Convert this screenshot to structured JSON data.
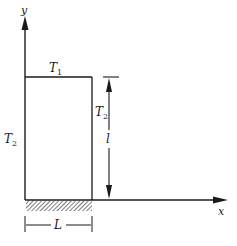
{
  "diagram": {
    "axes": {
      "x_label": "x",
      "y_label": "y"
    },
    "edges": {
      "top": {
        "symbol": "T",
        "subscript": "1"
      },
      "left": {
        "symbol": "T",
        "subscript": "2"
      },
      "right": {
        "symbol": "T",
        "subscript": "2"
      }
    },
    "dimensions": {
      "height_label": "l",
      "width_label": "L"
    },
    "colors": {
      "line": "#1a1a1a",
      "hatch": "#555555",
      "background": "#ffffff"
    }
  }
}
